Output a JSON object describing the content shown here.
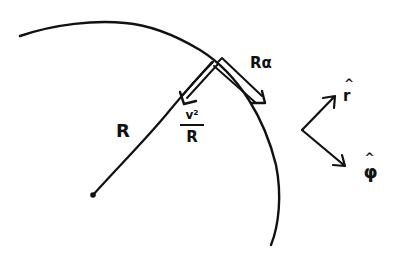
{
  "diagram": {
    "type": "hand-drawn physics sketch: circular motion",
    "colors": {
      "ink": "#111111",
      "background": "#ffffff"
    },
    "circle_arc": {
      "description": "arc of circle of radius R",
      "center": [
        93,
        195
      ]
    },
    "labels": {
      "radius": "R",
      "tangential_accel": "Rα",
      "centripetal_num": "v²",
      "centripetal_den": "R",
      "unit_r": "r",
      "unit_phi": "φ"
    },
    "vectors": [
      {
        "name": "centripetal-acceleration",
        "label": "v²/R",
        "direction": "toward center"
      },
      {
        "name": "tangential-acceleration",
        "label": "Rα",
        "direction": "along tangent"
      },
      {
        "name": "unit-vector-r",
        "label": "r̂",
        "direction": "up-right"
      },
      {
        "name": "unit-vector-phi",
        "label": "φ̂",
        "direction": "down-right"
      }
    ]
  }
}
